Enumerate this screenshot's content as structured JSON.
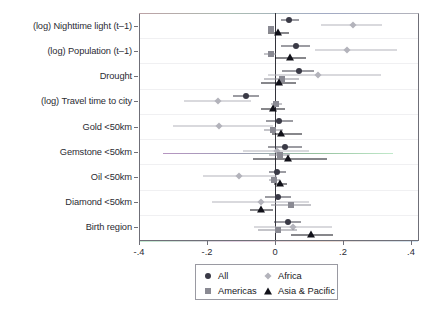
{
  "chart_data": {
    "type": "scatter",
    "subtype": "coefficient-plot-with-confidence-intervals",
    "title": "",
    "xlabel": "",
    "ylabel": "",
    "xlim": [
      -0.4,
      0.4
    ],
    "xticks": [
      -0.4,
      -0.2,
      0,
      0.2,
      0.4
    ],
    "xticklabels": [
      "-.4",
      "-.2",
      "0",
      ".2",
      ".4"
    ],
    "grid": "horizontal-light",
    "reference_line": 0,
    "legend_position": "bottom-center",
    "categories": [
      "(log) Nighttime light (t–1)",
      "(log) Population (t–1)",
      "Drought",
      "(log) Travel time to city",
      "Gold <50km",
      "Gemstone <50km",
      "Oil <50km",
      "Diamond <50km",
      "Birth region"
    ],
    "series": [
      {
        "name": "All",
        "marker": "circle",
        "color": "#3a3a46",
        "points": [
          {
            "category": "(log) Nighttime light (t–1)",
            "estimate": 0.042,
            "ci_low": 0.018,
            "ci_high": 0.072
          },
          {
            "category": "(log) Population (t–1)",
            "estimate": 0.061,
            "ci_low": 0.018,
            "ci_high": 0.103
          },
          {
            "category": "Drought",
            "estimate": 0.07,
            "ci_low": 0.022,
            "ci_high": 0.115
          },
          {
            "category": "(log) Travel time to city",
            "estimate": -0.086,
            "ci_low": -0.125,
            "ci_high": -0.046
          },
          {
            "category": "Gold <50km",
            "estimate": 0.013,
            "ci_low": -0.027,
            "ci_high": 0.052
          },
          {
            "category": "Gemstone <50km",
            "estimate": 0.03,
            "ci_low": -0.02,
            "ci_high": 0.08
          },
          {
            "category": "Oil <50km",
            "estimate": 0.007,
            "ci_low": -0.017,
            "ci_high": 0.031
          },
          {
            "category": "Diamond <50km",
            "estimate": 0.009,
            "ci_low": -0.029,
            "ci_high": 0.048
          },
          {
            "category": "Birth region",
            "estimate": 0.037,
            "ci_low": -0.002,
            "ci_high": 0.077
          }
        ]
      },
      {
        "name": "Africa",
        "marker": "diamond",
        "color": "#b3b3bb",
        "points": [
          {
            "category": "(log) Nighttime light (t–1)",
            "estimate": 0.228,
            "ci_low": 0.134,
            "ci_high": 0.315
          },
          {
            "category": "(log) Population (t–1)",
            "estimate": 0.212,
            "ci_low": 0.117,
            "ci_high": 0.36
          },
          {
            "category": "Drought",
            "estimate": 0.126,
            "ci_low": -0.02,
            "ci_high": 0.312
          },
          {
            "category": "(log) Travel time to city",
            "estimate": -0.169,
            "ci_low": -0.268,
            "ci_high": -0.071
          },
          {
            "category": "Gold <50km",
            "estimate": -0.165,
            "ci_low": -0.3,
            "ci_high": -0.005
          },
          {
            "category": "Gemstone <50km",
            "estimate": 0.005,
            "ci_low": -0.093,
            "ci_high": 0.1
          },
          {
            "category": "Oil <50km",
            "estimate": -0.106,
            "ci_low": -0.213,
            "ci_high": 0.005
          },
          {
            "category": "Diamond <50km",
            "estimate": -0.041,
            "ci_low": -0.186,
            "ci_high": 0.1
          },
          {
            "category": "Birth region",
            "estimate": 0.052,
            "ci_low": -0.062,
            "ci_high": 0.169
          }
        ]
      },
      {
        "name": "Americas",
        "marker": "square",
        "color": "#8a8a93",
        "points": [
          {
            "category": "(log) Nighttime light (t–1)",
            "estimate": -0.011,
            "ci_low": -0.021,
            "ci_high": -0.002
          },
          {
            "category": "(log) Population (t–1)",
            "estimate": -0.013,
            "ci_low": -0.031,
            "ci_high": 0.003
          },
          {
            "category": "Drought",
            "estimate": 0.02,
            "ci_low": -0.033,
            "ci_high": 0.072
          },
          {
            "category": "(log) Travel time to city",
            "estimate": 0.003,
            "ci_low": -0.013,
            "ci_high": 0.02
          },
          {
            "category": "Gold <50km",
            "estimate": -0.006,
            "ci_low": -0.033,
            "ci_high": 0.025
          },
          {
            "category": "Gemstone <50km",
            "estimate": 0.014,
            "ci_low": -0.019,
            "ci_high": 0.045
          },
          {
            "category": "Oil <50km",
            "estimate": -0.002,
            "ci_low": -0.018,
            "ci_high": 0.014
          },
          {
            "category": "Diamond <50km",
            "estimate": 0.046,
            "ci_low": -0.013,
            "ci_high": 0.105
          },
          {
            "category": "Birth region",
            "estimate": 0.008,
            "ci_low": -0.05,
            "ci_high": 0.066
          }
        ]
      },
      {
        "name": "Asia & Pacific",
        "marker": "triangle",
        "color": "#111119",
        "points": [
          {
            "category": "(log) Nighttime light (t–1)",
            "estimate": 0.008,
            "ci_low": -0.022,
            "ci_high": 0.041
          },
          {
            "category": "(log) Population (t–1)",
            "estimate": 0.044,
            "ci_low": 0.0,
            "ci_high": 0.09
          },
          {
            "category": "Drought",
            "estimate": 0.012,
            "ci_low": -0.041,
            "ci_high": 0.061
          },
          {
            "category": "(log) Travel time to city",
            "estimate": -0.005,
            "ci_low": -0.042,
            "ci_high": 0.029
          },
          {
            "category": "Gold <50km",
            "estimate": 0.019,
            "ci_low": -0.009,
            "ci_high": 0.08
          },
          {
            "category": "Gemstone <50km",
            "estimate": 0.038,
            "ci_low": -0.065,
            "ci_high": 0.153
          },
          {
            "category": "Oil <50km",
            "estimate": 0.014,
            "ci_low": -0.003,
            "ci_high": 0.034
          },
          {
            "category": "Diamond <50km",
            "estimate": -0.042,
            "ci_low": -0.074,
            "ci_high": -0.006
          },
          {
            "category": "Birth region",
            "estimate": 0.107,
            "ci_low": 0.046,
            "ci_high": 0.17
          }
        ]
      }
    ],
    "legend": [
      {
        "label": "All",
        "marker": "circle"
      },
      {
        "label": "Africa",
        "marker": "diamond"
      },
      {
        "label": "Americas",
        "marker": "square"
      },
      {
        "label": "Asia & Pacific",
        "marker": "triangle"
      }
    ]
  },
  "colors": {
    "all": "#3a3a46",
    "africa": "#b3b3bb",
    "americas": "#8a8a93",
    "asia_pacific": "#111119",
    "frame": "#6f6f78",
    "grid": "#f0f0f2",
    "zero_line": "#33333b",
    "background": "#ffffff"
  }
}
